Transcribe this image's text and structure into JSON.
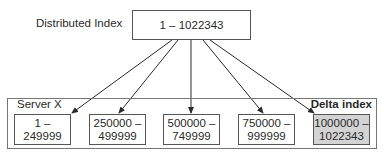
{
  "diagram": {
    "root_label": "Distributed Index",
    "root_range": "1 – 1022343",
    "server_label": "Server X",
    "delta_label": "Delta index",
    "shards": [
      {
        "range": "1 –\n249999",
        "delta": false
      },
      {
        "range": "250000 –\n499999",
        "delta": false
      },
      {
        "range": "500000 –\n749999",
        "delta": false
      },
      {
        "range": "750000 –\n999999",
        "delta": false
      },
      {
        "range": "1000000 –\n1022343",
        "delta": true
      }
    ],
    "colors": {
      "line": "#2a2a2a",
      "delta_fill": "#d3d3d3",
      "border": "#555555"
    }
  }
}
